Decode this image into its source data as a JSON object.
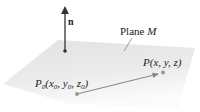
{
  "figure": {
    "plane_label_prefix": "Plane ",
    "plane_label_var": "M",
    "normal_label": "n",
    "p0_label": {
      "P": "P",
      "sub0": "0",
      "open": "(",
      "x": "x",
      "xs": "0",
      "c1": ", ",
      "y": "y",
      "ys": "0",
      "c2": ", ",
      "z": "z",
      "zs": "0",
      "close": ")"
    },
    "p_label": "P(x, y, z)"
  },
  "colors": {
    "plane": "#e6e6e6",
    "normal_vector": "#333333",
    "vector_p0p": "#8a8a8a",
    "points": "#9a9a9a",
    "text": "#222222"
  }
}
